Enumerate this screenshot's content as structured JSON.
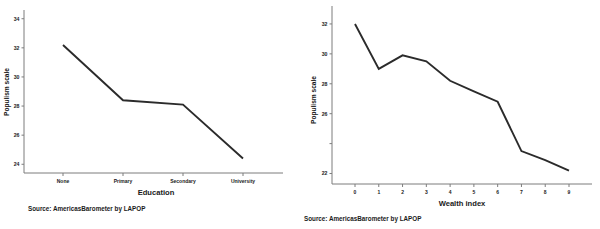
{
  "figure": {
    "background": "#ffffff",
    "line_color": "#2b2b2b",
    "axis_color": "#7d7d7d",
    "text_color": "#1a1a1a"
  },
  "panels": [
    {
      "id": "education-panel",
      "source_note": "Source:  AmericasBarometer by LAPOP"
    },
    {
      "id": "wealth-panel",
      "source_note": "Source:  AmericasBarometer by LAPOP"
    }
  ],
  "chart_data": [
    {
      "type": "line",
      "title": "",
      "xlabel": "Education",
      "ylabel": "Populism scale",
      "categories": [
        "None",
        "Primary",
        "Secondary",
        "University"
      ],
      "values": [
        32.2,
        28.4,
        28.1,
        24.4
      ],
      "ylim": [
        23.4,
        34.6
      ],
      "yticks": [
        24,
        26,
        28,
        30,
        32,
        34
      ],
      "ytick_labels": [
        "24",
        "26",
        "28",
        "30",
        "32",
        "34"
      ],
      "grid": false,
      "legend": "none"
    },
    {
      "type": "line",
      "title": "",
      "xlabel": "Wealth index",
      "ylabel": "Populism scale",
      "categories": [
        "0",
        "1",
        "2",
        "3",
        "4",
        "5",
        "6",
        "7",
        "8",
        "9"
      ],
      "x": [
        0,
        1,
        2,
        3,
        4,
        5,
        6,
        7,
        8,
        9
      ],
      "values": [
        32.0,
        29.0,
        29.9,
        29.5,
        28.2,
        27.5,
        26.8,
        23.5,
        22.9,
        22.2
      ],
      "ylim": [
        21.3,
        33.2
      ],
      "yticks": [
        22,
        24,
        26,
        28,
        30,
        32
      ],
      "ytick_labels": [
        "22",
        "24",
        "26",
        "28",
        "30",
        "32"
      ],
      "ytick_labels_shown": [
        "22",
        "",
        "26",
        "28",
        "30",
        "32"
      ],
      "grid": false,
      "legend": "none"
    }
  ]
}
